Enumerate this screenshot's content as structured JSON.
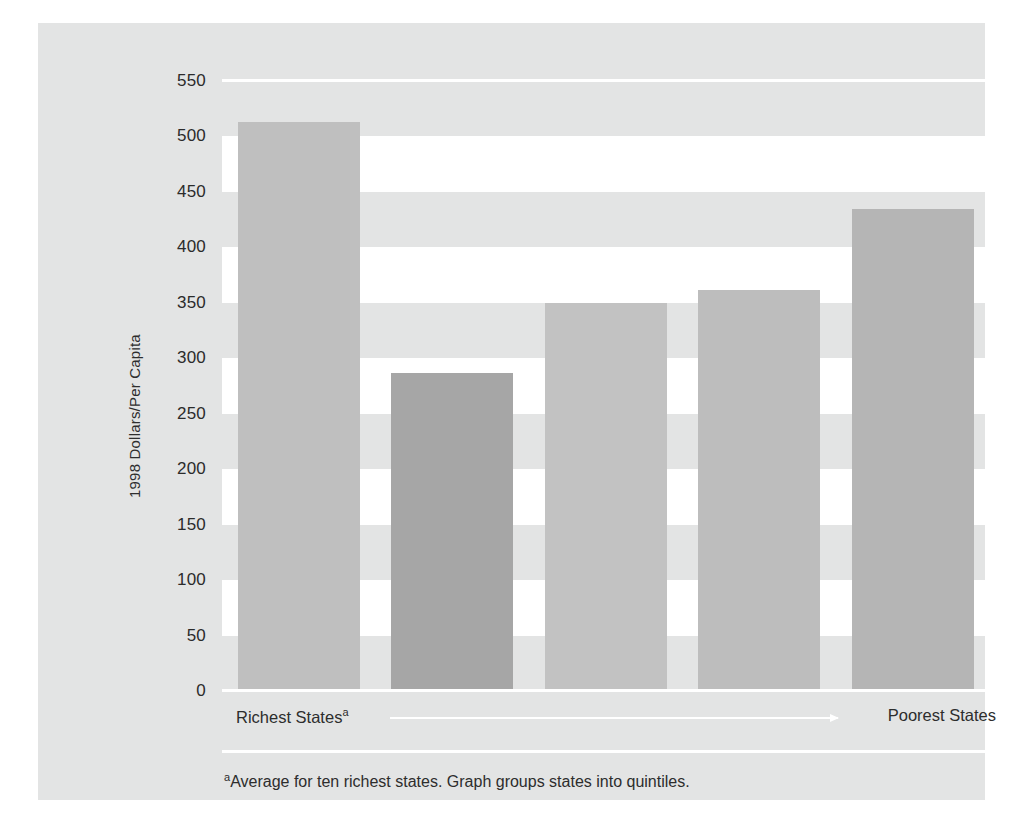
{
  "figure": {
    "background_color": "#e3e4e4",
    "band_color": "#ffffff",
    "y_axis_title": "1998 Dollars/Per Capita",
    "axis_left_label": "Richest States",
    "axis_left_label_marker": "a",
    "axis_right_label": "Poorest States",
    "arrow_icon": "right-arrow-icon",
    "footnote_marker": "a",
    "footnote": "Average for ten richest states. Graph groups states into quintiles."
  },
  "chart_data": {
    "type": "bar",
    "title": "",
    "subtitle": "",
    "xlabel": "",
    "ylabel": "1998 Dollars/Per Capita",
    "categories": [
      "Quintile 1",
      "Quintile 2",
      "Quintile 3",
      "Quintile 4",
      "Quintile 5"
    ],
    "values": [
      513,
      287,
      350,
      362,
      435
    ],
    "bar_colors": [
      "#bfbfbf",
      "#a6a6a6",
      "#c2c2c2",
      "#bdbdbd",
      "#b5b5b5"
    ],
    "ylim": [
      0,
      550
    ],
    "yticks": [
      0,
      50,
      100,
      150,
      200,
      250,
      300,
      350,
      400,
      450,
      500,
      550
    ],
    "ytick_labels": [
      "0",
      "50",
      "100",
      "150",
      "200",
      "250",
      "300",
      "350",
      "400",
      "450",
      "500",
      "550"
    ],
    "grid": "alternating-horizontal-bands",
    "legend": "none",
    "annotations": [
      "Richest States",
      "Poorest States",
      "aAverage for ten richest states. Graph groups states into quintiles."
    ]
  }
}
